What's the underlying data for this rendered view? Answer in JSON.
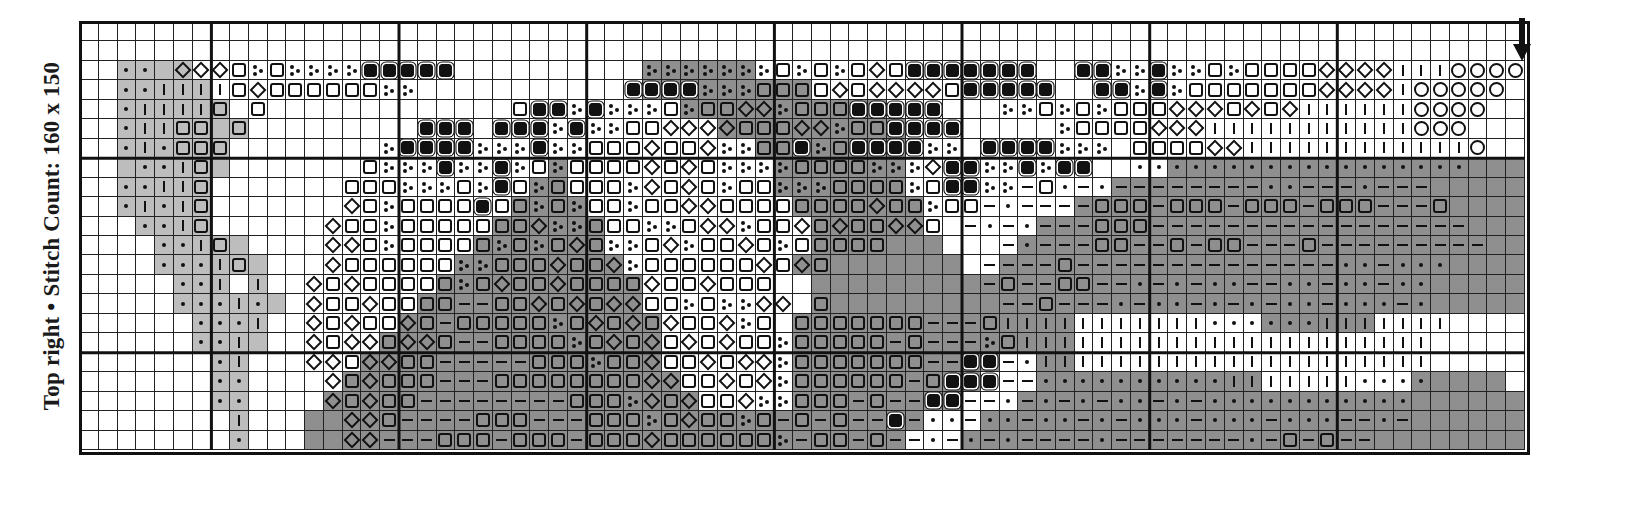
{
  "label": {
    "text": "Top right  • Stitch Count: 160 x 150",
    "position": "Top right",
    "stitch_count": "160 x 150"
  },
  "chart": {
    "columns": 77,
    "rows": 22,
    "heavy_cols": [
      7,
      17,
      27,
      37,
      47,
      57,
      67
    ],
    "heavy_rows": [
      7,
      17
    ],
    "start_arrow": {
      "direction": "down",
      "column": 76,
      "icon": "arrow-down-icon"
    },
    "legend_codes": {
      ".": "empty",
      "q": "square-outline-symbol",
      "Q": "square-filled-symbol",
      "d": "diamond-symbol",
      "o": "circle-symbol",
      "p": "dot-symbol",
      "-": "dash-symbol",
      "|": "vertical-bar-symbol",
      "t": "three-dots-symbol"
    },
    "fill_codes": {
      "w": "#ffffff",
      "l": "#bdbdbd",
      "k": "#8f8f8f"
    },
    "symbols": [
      ".............................................................................",
      ".............................................................................",
      "..pp.dddqtqttttQQQQQ..........tttttttqtqtqdqQQQQQQQ..QQttQttqtqqqqdddd|||oooooo",
      "..pp||||qdqqqqqqtt...........QQQQtttqqqqdqddddqQQQQQ..QQtQtqqqqqqqdddd|ooooo",
      "..p||||q.q.............qQQtQtttqtqqddtqqqQQQQQ...ttqtqtqqqdddqdqd||||||oooo",
      "..p||qq.q.........QQQ.QQQtQttqqddddqqqddtqqQQQQ.....tqqqqddd|||||||||||ooo",
      "..p|pqqq........tQQQQtttQttqqqdqqdttqqQtqQQQQtt.QQQQttt.qqqqdd||||||||||||o",
      "...pp|q........qtttQttQtqtqqqqdqdqttttqqqqtttdQQttQtQQ..pppppppppppppppppp",
      "..pp||q.......qqqtttqtQqtqqqqtdqdqtqqtttqqqqtqQQtt-qp-p--------pp---p---",
      "..p|p|q.......dqtqqqqQqqtqtqqtqqddqqqqqqqqdqqtqq-p----qqq-qqq-qqq-qqq---q",
      "...pp|q......dqqtqqqqqqqdttqqqttqddtqqdqdqqddq.-p-p---qqq-----------------",
      "....pp|q.....ddqtqqqqqtqtqdqttqdtqqdqtqqqqq......-p---qq--q-qq---q---------",
      "....ppp|q....dqqqqqqttqqqdqqdtqqqqqqdqdq........----q--------------pp-ppp",
      ".....pp|.|..dqdqqqqqtqdqqdqqqqdqqdqqq...........-q--qq--p-p-pp--pp-pp-pp",
      ".....ppp|p..dqqdqqqq--qqdqdqddqqtqttdd.q.........--q---p-pp-p-p-pp-ppp-p",
      "......ppp|..dqdqqdq-qqqqqtqdqdqdqqdtq.qqqqqqq---q|||||||||||pppppp|||||||",
      "......pp|...dqddqddq--qqqqtqdqdqdqdqqtqqqqq-q---tq||||||||||||||||||||||",
      ".......p|...ddqddqq-----qqqtqqdqqdqddtqqqqqqq--QQ-p|||||||||||||||||||||",
      ".......pp....dqdqqq---qqqqqqqqddqqdqdtqqqqqq-qQQQ--pppppppppp|||||||pppp",
      ".......pp....dqdqq--------qqqtdqdqqdttqqq-q--QQ--p-p-p-pp-p-ppppppppppp",
      "........|.....ddq----qqq---qqqtqdqqtq-q-q--Q-pp-pp-pp-p-ppp-ppp-ppp--p-",
      "........p.....dd---qqq-qqq-qqqdqqqqqqt-qq-q--p-p-p----p-------p-q-q--"
    ],
    "fills": [
      "wwwwwwwwwwwwwwwwwwwwwwwwwwwwwwwwwwwwwwwwwwwwwwwwwwwwwwwwwwwwwwwwwwwwwwwwwwwww",
      "wwwwwwwwwwwwwwwwwwwwwwwwwwwwwwwwwwwwwwwwwwwwwwwwwwwwwwwwwwwwwwwwwwwwwwwwwwwww",
      "wwllllwwwwwwwwwwwwwwwwwwwwwwwwkkkkkkwwwwwwwwwwwwwwwwwwwwwwwwwwwwwwwwwwwwwwwww",
      "wwlllllwwwwwwwwwwwwwwwwwwwwwwwkkkkkkkkkwwwwwwwwwwwwwwwwwwwwwwwwwwwwwwwwwwwwww",
      "wwllllllwwwwwwwwwwwwwwwwwwwwwwwwkkkkkkkkkkkwwwwwwwwwwwwwwwwwwwwwwwwwwwwwwwwww",
      "wwlllllllwwwwwwwwwwwwwwwwwwwwwwwwwkkkkkkkkkkwwwwwwwwwwwwwwwwwwwwwwwwwwwwwwwww",
      "wwllllllwwwwwwwwwwwwwwwwwwwwwwwwwwwwkkkkkkkkwwwwwwwwwwwwwwwwwwwwwwwwwwwwwwwww",
      "wwllllllwwwwwwwwwwwwwwwwwkwwwwwwwwwwwkkkkkkkwwwwwwwwwwwwwwkkkkkkkkkkkkkkkkkkkk",
      "wwlllllwwwwwwwwwwwwwwwwwkkwwwwwwwwwwwkkkkkkkwwwwwwwwwwwkkkkkkkkkkkkkkkkkkkkkk",
      "wwlllllwwwwwwwwwwwwwwwwkkkkwwwwwwwwwwwkkkkkkkwwwwwwwwkkkkkkkkkkkkkkkkkkkkkkkk",
      "wwwllllwwwwwwwwwwwwwwwkkkkkkwwwwwwwwwwwkkkkkkwwwwwwkkkkkkkkkkkkkkkkkkkkkkkkkk",
      "wwwwlllllwwwwwwwwwwwwkkkkkkkwwwwwwwwwwwkkkkkkkwwwwkkkkkkkkkkkkkkkkkkkkkkkkkkk",
      "wwwwllllllwwwwwwwwwwkkkkkkkkkwwwwwwwwwkkkkkkkkkwwkkkkkkkkkkkkkkkkkkkkkkkkkkkk",
      "wwwwwlllwlwwwwwwwwwkkkkkkkkkkkwwwwwwwwwkkkkkkkkkkkkkkkkkkkkkkkkkkkkkkkkkkkkkk",
      "wwwwwllllllwwwwwwwkkkkkkkkkkkkwwwwwwwwwkkkkkkkkkkkkkkkkkkkkkkkkkkkkkkkkkkkkkk",
      "wwwwwwllllwwwwwwwkkkkkkkkkkkkkkwwwwwwwkkkkkkkkkkkkkkkwwwwwwwwwwkkkkkkwwwwwwww",
      "wwwwwwllllwwwwwwkkkkkkkkkkkkkkkwwwwwwwkkkkkkkkkkkkkkkwwwwwwwwwwwwwwwwwwwwwwww",
      "wwwwwwwllwwwwwwkkkkkkkkkkkkkkkkwwwwwwwkkkkkkkkkkkwwkkwwwwwwwwwwwwwwwwwwwwwwww",
      "wwwwwwwllwwwwwkkkkkkkkkkkkkkkkkkwwwwwwkkkkkkkkkkwwwkkkkkkkkkkkkwwwwwwwwkkkkk",
      "wwwwwwwllwwwwkkkkkkkkkkkkkkkkkkkkwwwwwkkkkkkkkkwwwkkkkkkkkkkkkkkkkkkkkkkkkkkk",
      "wwwwwwwwlwwwkkkkkkkkkkkkkkkkkkkkkkkkkkkkkkkkkwwwkkkkkkkkkkkkkkkkkkkkkkkkkkkkk",
      "wwwwwwwwlwwwkkkkkkkkkkkkkkkkkkkkkkkkkkkkkkkkwwwkkkkkkkkkkkkkkkkkkkkkkkkkkkkkk"
    ]
  }
}
